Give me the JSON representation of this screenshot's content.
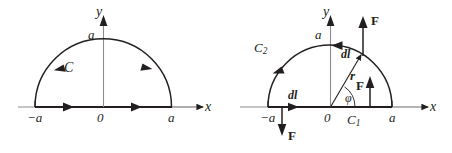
{
  "figure": {
    "background_color": "#ffffff",
    "ink_color": "#231f20",
    "panels": [
      {
        "id": "left-panel",
        "name": "semicircular-contour-C",
        "center": {
          "x": 103,
          "y": 107
        },
        "radius": 68,
        "axes": {
          "x_axis_label": "x",
          "y_axis_label": "y",
          "origin_label": "0"
        },
        "ticks": [
          {
            "name": "x-tick-negative-a",
            "label": "−a",
            "x": -68
          },
          {
            "name": "x-tick-positive-a",
            "label": "a",
            "x": 68
          },
          {
            "name": "y-tick-a",
            "label": "a",
            "y": 68
          }
        ],
        "curve_labels": [
          {
            "name": "contour-label-C",
            "label": "C"
          }
        ],
        "direction_arrows": [
          {
            "name": "arc-arrow-left",
            "on": "arc",
            "direction": "counterclockwise"
          },
          {
            "name": "arc-arrow-right",
            "on": "arc",
            "direction": "counterclockwise"
          },
          {
            "name": "axis-arrow-left",
            "on": "x-segment",
            "direction": "rightward"
          },
          {
            "name": "axis-arrow-right",
            "on": "x-segment",
            "direction": "rightward"
          }
        ]
      },
      {
        "id": "right-panel",
        "name": "semicircular-contour-C1-C2-with-force-field",
        "center": {
          "x": 330,
          "y": 107
        },
        "radius": 62,
        "axes": {
          "x_axis_label": "x",
          "y_axis_label": "y",
          "origin_label": "0"
        },
        "ticks": [
          {
            "name": "x-tick-negative-a",
            "label": "−a",
            "x": -62
          },
          {
            "name": "x-tick-positive-a",
            "label": "a",
            "x": 62
          },
          {
            "name": "y-tick-a",
            "label": "a",
            "y": 62
          }
        ],
        "curve_labels": [
          {
            "name": "contour-label-C1",
            "label": "C",
            "subscript": "1",
            "on": "x-axis segment"
          },
          {
            "name": "contour-label-C2",
            "label": "C",
            "subscript": "2",
            "on": "arc"
          }
        ],
        "vector_labels": [
          {
            "name": "radius-vector-label-r",
            "label": "r",
            "style": "bold-italic"
          },
          {
            "name": "angle-label-phi",
            "label": "φ",
            "style": "italic"
          },
          {
            "name": "element-label-dl-arc",
            "label": "dl",
            "style": "bold-italic"
          },
          {
            "name": "element-label-dl-axis",
            "label": "dl",
            "style": "bold-italic"
          },
          {
            "name": "force-label-F-top",
            "label": "F",
            "style": "bold",
            "direction": "up"
          },
          {
            "name": "force-label-F-right",
            "label": "F",
            "style": "bold",
            "direction": "up"
          },
          {
            "name": "force-label-F-bottom",
            "label": "F",
            "style": "bold",
            "direction": "down"
          }
        ],
        "direction_arrows": [
          {
            "name": "arc-arrow-left",
            "on": "arc",
            "direction": "counterclockwise"
          },
          {
            "name": "arc-arrow-top",
            "on": "arc",
            "direction": "counterclockwise"
          },
          {
            "name": "axis-arrow",
            "on": "x-segment",
            "direction": "rightward"
          }
        ]
      }
    ]
  }
}
